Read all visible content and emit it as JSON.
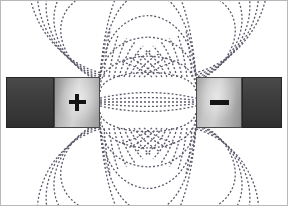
{
  "figure": {
    "title": "Magnetic field lines between opposite poles",
    "width": 288,
    "height": 206,
    "background_color": "#ffffff",
    "border_color": "#b8b8b8"
  },
  "magnets": {
    "left": {
      "label": "+",
      "pole_name": "positive-pole",
      "shaft": {
        "x": 6,
        "y": 77,
        "width": 48,
        "height": 51,
        "color": "#3b3b3b"
      },
      "face": {
        "x": 54,
        "y": 77,
        "width": 46,
        "height": 51,
        "color_light": "#d3d3d3",
        "color_dark": "#8d8d8d"
      },
      "sign_color": "#141414"
    },
    "right": {
      "label": "−",
      "pole_name": "negative-pole",
      "face": {
        "x": 196,
        "y": 77,
        "width": 46,
        "height": 51,
        "color_light": "#cfcfcf",
        "color_dark": "#8f8f8f"
      },
      "shaft": {
        "x": 242,
        "y": 77,
        "width": 40,
        "height": 51,
        "color": "#3b3b3b"
      },
      "sign_color": "#141414"
    }
  },
  "field": {
    "line_color": "#5a5a6a",
    "line_style": "dashed",
    "dash_pattern": [
      2,
      2
    ],
    "line_width": 1.3,
    "line_count": 26,
    "description": "Dashed curved field lines running from the positive pole face to the negative pole face, bowing outward above and below the magnet axis, plus near-straight lines across the central gap."
  },
  "chart_data": {
    "type": "line",
    "title": "Magnetic field lines between opposite poles",
    "xlabel": "",
    "ylabel": "",
    "xlim": [
      0,
      288
    ],
    "ylim": [
      0,
      206
    ],
    "grid": false,
    "legend": "none",
    "annotations": [
      "+",
      "−"
    ],
    "source_pole_x": 100,
    "sink_pole_x": 196,
    "axis_y": 102,
    "series": [
      {
        "name": "gap-line-0",
        "bow": 0,
        "values": []
      },
      {
        "name": "gap-line-1",
        "bow": 6,
        "values": []
      },
      {
        "name": "gap-line-2",
        "bow": -6,
        "values": []
      },
      {
        "name": "gap-line-3",
        "bow": 13,
        "values": []
      },
      {
        "name": "gap-line-4",
        "bow": -13,
        "values": []
      },
      {
        "name": "arc-line-5",
        "bow": 22,
        "values": []
      },
      {
        "name": "arc-line-6",
        "bow": -22,
        "values": []
      },
      {
        "name": "arc-line-7",
        "bow": 34,
        "values": []
      },
      {
        "name": "arc-line-8",
        "bow": -34,
        "values": []
      },
      {
        "name": "arc-line-9",
        "bow": 48,
        "values": []
      },
      {
        "name": "arc-line-10",
        "bow": -48,
        "values": []
      },
      {
        "name": "arc-line-11",
        "bow": 64,
        "values": []
      },
      {
        "name": "arc-line-12",
        "bow": -64,
        "values": []
      },
      {
        "name": "arc-line-13",
        "bow": 82,
        "values": []
      },
      {
        "name": "arc-line-14",
        "bow": -82,
        "values": []
      },
      {
        "name": "arc-line-15",
        "bow": 102,
        "values": []
      },
      {
        "name": "arc-line-16",
        "bow": -102,
        "values": []
      },
      {
        "name": "outer-line-17",
        "bow": 126,
        "values": []
      },
      {
        "name": "outer-line-18",
        "bow": -126,
        "values": []
      },
      {
        "name": "outer-line-19",
        "bow": 152,
        "values": []
      },
      {
        "name": "outer-line-20",
        "bow": -152,
        "values": []
      },
      {
        "name": "outer-line-21",
        "bow": 182,
        "values": []
      },
      {
        "name": "outer-line-22",
        "bow": -182,
        "values": []
      },
      {
        "name": "outer-line-23",
        "bow": 216,
        "values": []
      },
      {
        "name": "outer-line-24",
        "bow": -216,
        "values": []
      },
      {
        "name": "outer-line-25",
        "bow": 252,
        "values": []
      }
    ]
  }
}
